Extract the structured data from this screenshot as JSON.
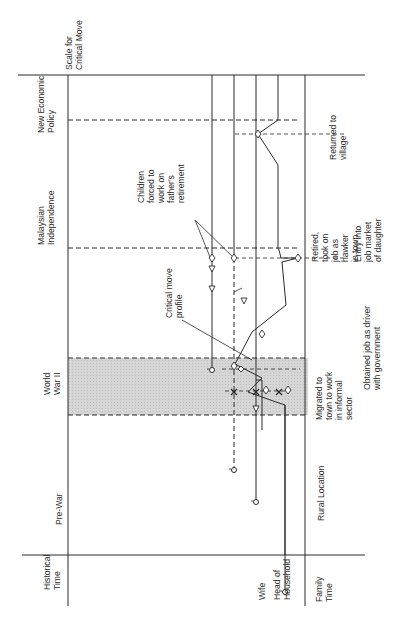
{
  "orientation": "rotated-90-ccw",
  "row_labels": {
    "historical_time": [
      "Historical",
      "Time"
    ],
    "wife": "Wife",
    "head_of_household": [
      "Head of",
      "Household"
    ],
    "family_time": [
      "Family",
      "Time"
    ],
    "scale_for_critical_move": [
      "Scale for",
      "Critical  Move"
    ]
  },
  "historical_periods": {
    "pre_war": "Pre-War",
    "world_war_ii": [
      "World",
      "War II"
    ],
    "malaysian_independence": [
      "Malaysian",
      "Independence"
    ],
    "new_economic_policy": [
      "New Economic",
      "Policy"
    ]
  },
  "location_labels": {
    "rural": "Rural Location"
  },
  "events": {
    "migrated": [
      "Migrated to",
      "town to work",
      "in informal",
      "sector"
    ],
    "obtained_job": [
      "Obtained job as driver",
      "with government"
    ],
    "retired": [
      "Retired,",
      "took on",
      "job as",
      "hawker",
      "in town"
    ],
    "entry_job_market": [
      "Entry into",
      "job market",
      "of daughter"
    ],
    "returned_village": [
      "Returned to",
      "village"
    ]
  },
  "annotations": {
    "critical_move_profile": [
      "Critical move",
      "profile"
    ],
    "children_forced": [
      "Children",
      "forced to",
      "work on",
      "father's",
      "retirement"
    ]
  },
  "symbols": {
    "birth": "circle-with-cross",
    "event": "diamond",
    "death_or_end": "x-mark",
    "child_event": "triangle"
  },
  "colors": {
    "ink": "#2a2a2a",
    "shade": "#d4d4d4"
  }
}
